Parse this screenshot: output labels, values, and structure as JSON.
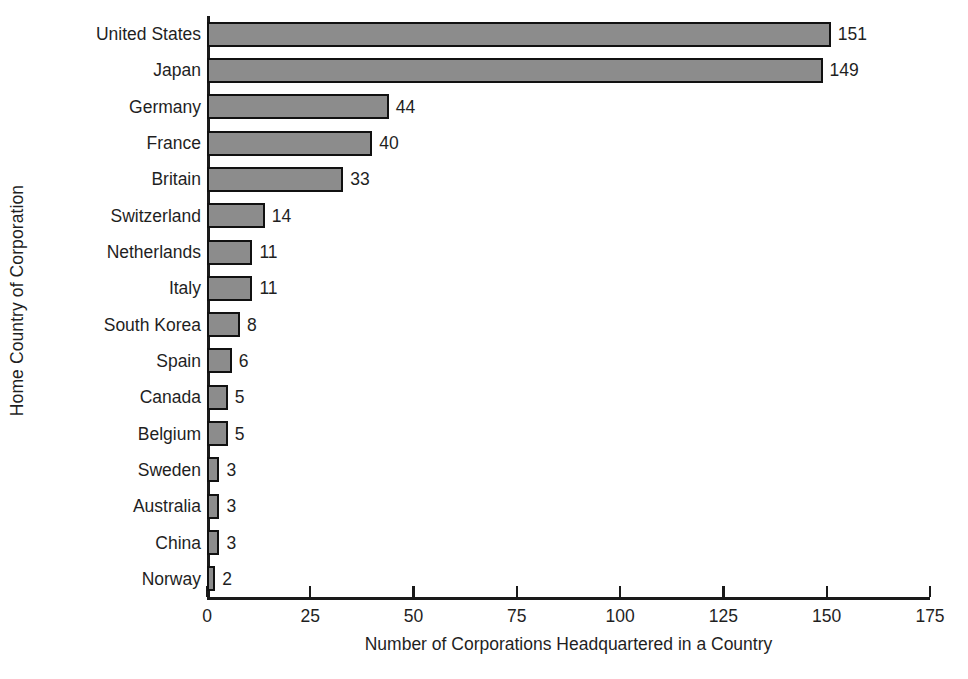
{
  "chart_data": {
    "type": "bar",
    "orientation": "horizontal",
    "title": "",
    "xlabel": "Number of Corporations Headquartered in a Country",
    "ylabel": "Home Country of Corporation",
    "categories": [
      "United States",
      "Japan",
      "Germany",
      "France",
      "Britain",
      "Switzerland",
      "Netherlands",
      "Italy",
      "South Korea",
      "Spain",
      "Canada",
      "Belgium",
      "Sweden",
      "Australia",
      "China",
      "Norway"
    ],
    "values": [
      151,
      149,
      44,
      40,
      33,
      14,
      11,
      11,
      8,
      6,
      5,
      5,
      3,
      3,
      3,
      2
    ],
    "data_labels": [
      "151",
      "149",
      "44",
      "40",
      "33",
      "14",
      "11",
      "11",
      "8",
      "6",
      "5",
      "5",
      "3",
      "3",
      "3",
      "2"
    ],
    "xlim": [
      0,
      175
    ],
    "xticks": [
      0,
      25,
      50,
      75,
      100,
      125,
      150,
      175
    ],
    "xtick_labels": [
      "0",
      "25",
      "50",
      "75",
      "100",
      "125",
      "150",
      "175"
    ],
    "grid": false,
    "legend": false,
    "bar_fill_color": "#8c8c8c",
    "bar_border_color": "#111111",
    "axis_color": "#1a1a1a",
    "background_color": "#ffffff"
  }
}
